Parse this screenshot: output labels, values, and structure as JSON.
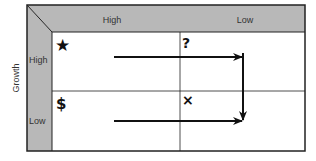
{
  "diagram": {
    "type": "growth-share matrix",
    "y_axis_label": "Growth",
    "columns": [
      "High",
      "Low"
    ],
    "rows": [
      "High",
      "Low"
    ],
    "cells": [
      {
        "row": "High",
        "col": "High",
        "symbol": "★",
        "icon": "star-icon"
      },
      {
        "row": "High",
        "col": "Low",
        "symbol": "?",
        "icon": "question-mark-icon"
      },
      {
        "row": "Low",
        "col": "High",
        "symbol": "$",
        "icon": "dollar-icon"
      },
      {
        "row": "Low",
        "col": "Low",
        "symbol": "×",
        "icon": "cross-icon"
      }
    ],
    "arrows": [
      {
        "from": "star cell",
        "to": "question cell right side",
        "direction": "right"
      },
      {
        "from": "question cell right side",
        "to": "cross cell",
        "direction": "down"
      },
      {
        "from": "dollar cell",
        "to": "cross cell",
        "direction": "right"
      }
    ],
    "colors": {
      "band": "#b8b8b8",
      "line": "#222222",
      "background": "#ffffff"
    }
  }
}
